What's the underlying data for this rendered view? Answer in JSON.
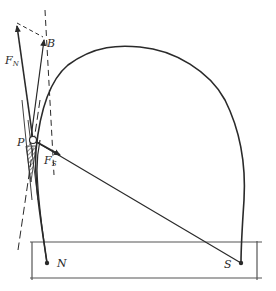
{
  "diagram": {
    "type": "mechanics-force-diagram",
    "colors": {
      "ink": "#2a2a2a",
      "ground": "#555555",
      "background": "#ffffff"
    },
    "labels": {
      "force_normal": {
        "main": "F",
        "sub": "N"
      },
      "force_s": {
        "main": "F",
        "sub": "S"
      },
      "point_b": "B",
      "point_p": "P",
      "point_n": "N",
      "point_s": "S"
    },
    "points": {
      "P": [
        33,
        140
      ],
      "N": [
        47,
        263
      ],
      "S": [
        241,
        263
      ],
      "B": [
        45,
        40
      ],
      "FN_tip": [
        17,
        30
      ],
      "FS_tip": [
        60,
        157
      ]
    }
  }
}
